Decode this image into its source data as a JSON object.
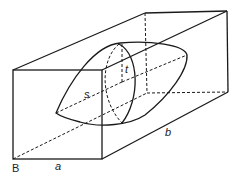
{
  "diagram": {
    "type": "3d-box-with-ellipsoid",
    "labels": {
      "corner": "B",
      "width": "a",
      "length": "b",
      "semi_axis_s": "s",
      "semi_axis_t": "t"
    },
    "colors": {
      "line": "#1a1a1a",
      "background": "#ffffff"
    }
  }
}
